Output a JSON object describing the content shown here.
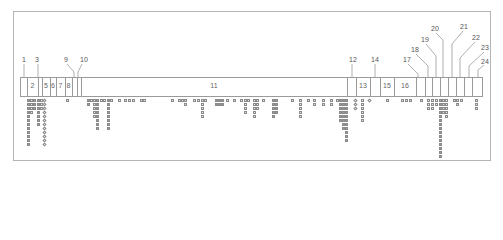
{
  "diagram": {
    "frame_color": "#b4b4b4",
    "line_color": "#9a9a9a",
    "segments": [
      {
        "id": "2",
        "label": "2",
        "x": 27,
        "w": 11
      },
      {
        "id": "4",
        "label": "",
        "x": 38,
        "w": 4
      },
      {
        "id": "5",
        "label": "5",
        "x": 42,
        "w": 8
      },
      {
        "id": "6",
        "label": "6",
        "x": 50,
        "w": 6
      },
      {
        "id": "7",
        "label": "7",
        "x": 56,
        "w": 9
      },
      {
        "id": "8",
        "label": "8",
        "x": 65,
        "w": 7
      },
      {
        "id": "9",
        "label": "",
        "x": 72,
        "w": 5
      },
      {
        "id": "10",
        "label": "",
        "x": 77,
        "w": 4
      },
      {
        "id": "11",
        "label": "11",
        "x": 81,
        "w": 266
      },
      {
        "id": "12",
        "label": "",
        "x": 347,
        "w": 9
      },
      {
        "id": "13",
        "label": "13",
        "x": 356,
        "w": 14
      },
      {
        "id": "14",
        "label": "",
        "x": 370,
        "w": 10
      },
      {
        "id": "15",
        "label": "15",
        "x": 380,
        "w": 14
      },
      {
        "id": "16",
        "label": "16",
        "x": 394,
        "w": 22
      },
      {
        "id": "17",
        "label": "",
        "x": 416,
        "w": 9
      },
      {
        "id": "18",
        "label": "",
        "x": 425,
        "w": 7
      },
      {
        "id": "19",
        "label": "",
        "x": 432,
        "w": 8
      },
      {
        "id": "20",
        "label": "",
        "x": 440,
        "w": 8
      },
      {
        "id": "21",
        "label": "",
        "x": 448,
        "w": 8
      },
      {
        "id": "22",
        "label": "",
        "x": 456,
        "w": 8
      },
      {
        "id": "23",
        "label": "",
        "x": 464,
        "w": 8
      },
      {
        "id": "24",
        "label": "",
        "x": 472,
        "w": 11
      }
    ],
    "callouts": [
      {
        "label": "1",
        "x": 22,
        "y": 56
      },
      {
        "label": "3",
        "x": 35,
        "y": 56
      },
      {
        "label": "9",
        "x": 64,
        "y": 56
      },
      {
        "label": "10",
        "x": 80,
        "y": 56
      },
      {
        "label": "12",
        "x": 349,
        "y": 56
      },
      {
        "label": "14",
        "x": 371,
        "y": 56
      },
      {
        "label": "17",
        "x": 403,
        "y": 56
      },
      {
        "label": "18",
        "x": 411,
        "y": 46
      },
      {
        "label": "19",
        "x": 421,
        "y": 36
      },
      {
        "label": "20",
        "x": 431,
        "y": 25
      },
      {
        "label": "21",
        "x": 460,
        "y": 23
      },
      {
        "label": "22",
        "x": 472,
        "y": 34
      },
      {
        "label": "23",
        "x": 481,
        "y": 44
      },
      {
        "label": "24",
        "x": 481,
        "y": 58
      }
    ]
  }
}
